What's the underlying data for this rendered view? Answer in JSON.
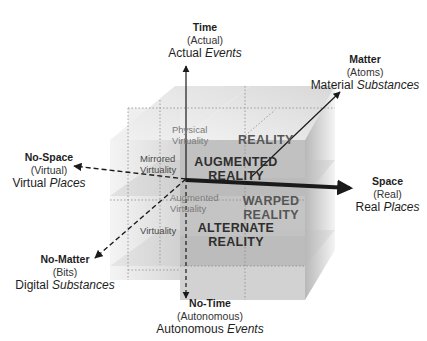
{
  "axes": {
    "time": {
      "title": "Time",
      "subtitle": "(Actual)",
      "desc_plain": "Actual ",
      "desc_italic": "Events"
    },
    "matter": {
      "title": "Matter",
      "subtitle": "(Atoms)",
      "desc_plain": "Material ",
      "desc_italic": "Substances"
    },
    "no_space": {
      "title": "No-Space",
      "subtitle": "(Virtual)",
      "desc_plain": "Virtual ",
      "desc_italic": "Places"
    },
    "space": {
      "title": "Space",
      "subtitle": "(Real)",
      "desc_plain": "Real ",
      "desc_italic": "Places"
    },
    "no_matter": {
      "title": "No-Matter",
      "subtitle": "(Bits)",
      "desc_plain": "Digital ",
      "desc_italic": "Substances"
    },
    "no_time": {
      "title": "No-Time",
      "subtitle": "(Autonomous)",
      "desc_plain": "Autonomous ",
      "desc_italic": "Events"
    }
  },
  "cells": {
    "physical_virtuality": [
      "Physical",
      "Virtuality"
    ],
    "mirrored_virtuality": [
      "Mirrored",
      "Virtuality"
    ],
    "augmented_virtuality": [
      "Augmented",
      "Virtuality"
    ],
    "virtuality": [
      "Virtuality"
    ],
    "reality": [
      "REALITY"
    ],
    "augmented_reality": [
      "AUGMENTED",
      "REALITY"
    ],
    "warped_reality": [
      "WARPED",
      "REALITY"
    ],
    "alternate_reality": [
      "ALTERNATE",
      "REALITY"
    ]
  },
  "colors": {
    "line": "#1a1a1a",
    "cube_light": "#e6e6e6",
    "cube_mid": "#c8c8c8",
    "cube_dark": "#a8a8a8"
  }
}
